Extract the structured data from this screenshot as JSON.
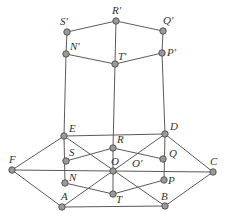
{
  "diagram": {
    "type": "geometry-projection",
    "colors": {
      "line": "#5a5a5a",
      "point_fill": "#9a9a9a",
      "point_stroke": "#555555",
      "label": "#333333"
    },
    "points": [
      {
        "id": "S1",
        "label": "S'",
        "x": 67,
        "y": 32,
        "lx": 60,
        "ly": 25
      },
      {
        "id": "R1",
        "label": "R'",
        "x": 116,
        "y": 21,
        "lx": 112,
        "ly": 14
      },
      {
        "id": "Q1",
        "label": "Q'",
        "x": 163,
        "y": 31,
        "lx": 163,
        "ly": 24
      },
      {
        "id": "N1",
        "label": "N'",
        "x": 66,
        "y": 54,
        "lx": 70,
        "ly": 50
      },
      {
        "id": "T1",
        "label": "T'",
        "x": 115,
        "y": 64,
        "lx": 118,
        "ly": 60
      },
      {
        "id": "P1",
        "label": "P'",
        "x": 162,
        "y": 53,
        "lx": 167,
        "ly": 56
      },
      {
        "id": "E",
        "label": "E",
        "x": 64,
        "y": 136,
        "lx": 69,
        "ly": 132
      },
      {
        "id": "D",
        "label": "D",
        "x": 165,
        "y": 134,
        "lx": 170,
        "ly": 130
      },
      {
        "id": "F",
        "label": "F",
        "x": 12,
        "y": 170,
        "lx": 9,
        "ly": 163
      },
      {
        "id": "C",
        "label": "C",
        "x": 213,
        "y": 172,
        "lx": 210,
        "ly": 165
      },
      {
        "id": "S",
        "label": "S",
        "x": 66,
        "y": 161,
        "lx": 69,
        "ly": 156
      },
      {
        "id": "R",
        "label": "R",
        "x": 113,
        "y": 148,
        "lx": 117,
        "ly": 143
      },
      {
        "id": "Q",
        "label": "Q",
        "x": 163,
        "y": 159,
        "lx": 169,
        "ly": 157
      },
      {
        "id": "O",
        "label": "O",
        "x": 113,
        "y": 171,
        "lx": 111,
        "ly": 165
      },
      {
        "id": "O1",
        "label": "O'",
        "x": 133,
        "y": 171,
        "lx": 132,
        "ly": 167,
        "marker": false
      },
      {
        "id": "N",
        "label": "N",
        "x": 65,
        "y": 183,
        "lx": 69,
        "ly": 181
      },
      {
        "id": "P",
        "label": "P",
        "x": 164,
        "y": 180,
        "lx": 168,
        "ly": 184
      },
      {
        "id": "T",
        "label": "T",
        "x": 113,
        "y": 194,
        "lx": 116,
        "ly": 203
      },
      {
        "id": "A",
        "label": "A",
        "x": 62,
        "y": 207,
        "lx": 61,
        "ly": 200
      },
      {
        "id": "B",
        "label": "B",
        "x": 165,
        "y": 206,
        "lx": 161,
        "ly": 200
      }
    ],
    "edges": [
      [
        "S1",
        "R1"
      ],
      [
        "R1",
        "Q1"
      ],
      [
        "S1",
        "N1"
      ],
      [
        "Q1",
        "P1"
      ],
      [
        "N1",
        "T1"
      ],
      [
        "T1",
        "P1"
      ],
      [
        "R1",
        "T1"
      ],
      [
        "N1",
        "E"
      ],
      [
        "T1",
        "R"
      ],
      [
        "P1",
        "D"
      ],
      [
        "F",
        "E"
      ],
      [
        "E",
        "D"
      ],
      [
        "D",
        "C"
      ],
      [
        "C",
        "B"
      ],
      [
        "B",
        "A"
      ],
      [
        "A",
        "F"
      ],
      [
        "F",
        "C"
      ],
      [
        "E",
        "B"
      ],
      [
        "D",
        "A"
      ],
      [
        "E",
        "N"
      ],
      [
        "D",
        "P"
      ],
      [
        "R",
        "T"
      ],
      [
        "S",
        "R"
      ],
      [
        "R",
        "Q"
      ],
      [
        "N",
        "T"
      ],
      [
        "T",
        "P"
      ]
    ]
  }
}
